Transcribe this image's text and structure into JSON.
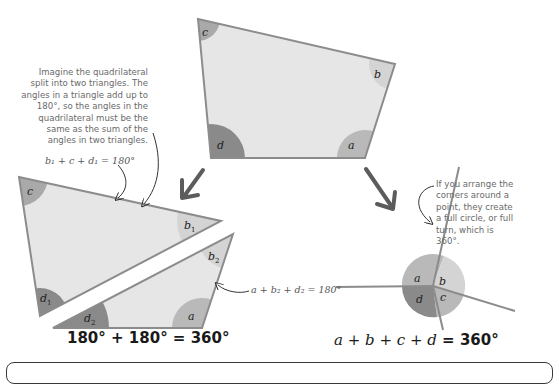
{
  "colors": {
    "shape_fill": "#e6e6e6",
    "shape_stroke": "#8c8c8c",
    "angle_a": "#b9b9b9",
    "angle_b": "#d4d4d4",
    "angle_c": "#a9a9a9",
    "angle_d": "#8a8a8a",
    "arrow": "#5c5c5c",
    "text": "#6a6a6a",
    "heading_text": "#1a1a1a"
  },
  "quadrilateral": {
    "labels": {
      "a": "a",
      "b": "b",
      "c": "c",
      "d": "d"
    }
  },
  "split_triangles": {
    "upper": {
      "labels": {
        "c": "c",
        "b": "b",
        "b_sub": "1",
        "d": "d",
        "d_sub": "1"
      }
    },
    "lower": {
      "labels": {
        "b": "b",
        "b_sub": "2",
        "a": "a",
        "d": "d",
        "d_sub": "2"
      }
    }
  },
  "circle_arrangement": {
    "labels": {
      "a": "a",
      "b": "b",
      "c": "c",
      "d": "d"
    }
  },
  "annotations": {
    "split_explanation": "Imagine the quadrilateral split into two triangles. The angles in a triangle add up to 180°, so the angles in the quadrilateral must be the same as the sum of the angles in two triangles.",
    "upper_triangle_equation": "b₁ + c + d₁ = 180°",
    "lower_triangle_equation": "a + b₂ + d₂ = 180°",
    "circle_explanation": "If you arrange the corners around a point, they create a full circle, or full turn, which is 360°."
  },
  "results": {
    "triangles_sum": "180° + 180° = 360°",
    "circle_sum_vars": "a + b + c + d",
    "circle_sum_value": " = 360°"
  }
}
